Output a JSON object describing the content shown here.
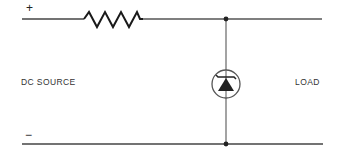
{
  "diagram": {
    "labels": {
      "source": "DC SOURCE",
      "load": "LOAD",
      "positive": "+",
      "negative": "−"
    },
    "components": [
      {
        "type": "resistor",
        "position": "series, top rail"
      },
      {
        "type": "zener-diode",
        "position": "shunt, between rails",
        "enclosed_in_circle": true
      }
    ],
    "colors": {
      "wire": "#444444",
      "component": "#222222",
      "text": "#333333",
      "background": "#ffffff"
    }
  }
}
